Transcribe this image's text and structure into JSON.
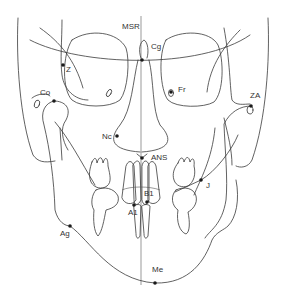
{
  "diagram": {
    "type": "frontal cephalometric tracing (PA view)",
    "colors": {
      "line": "#3a3a3a",
      "landmark": "#1a1a1a",
      "label": "#333333",
      "background": "#ffffff"
    },
    "midline_label": "MSR",
    "landmarks": [
      {
        "id": "Cg",
        "label": "Cg",
        "x": 146,
        "y": 62
      },
      {
        "id": "Z",
        "label": "Z",
        "x": 63,
        "y": 65
      },
      {
        "id": "Fr",
        "label": "Fr",
        "x": 171,
        "y": 92
      },
      {
        "id": "Co",
        "label": "Co",
        "x": 54,
        "y": 101
      },
      {
        "id": "ZA",
        "label": "ZA",
        "x": 251,
        "y": 106
      },
      {
        "id": "Nc",
        "label": "Nc",
        "x": 117,
        "y": 136
      },
      {
        "id": "ANS",
        "label": "ANS",
        "x": 142,
        "y": 158
      },
      {
        "id": "J",
        "label": "J",
        "x": 201,
        "y": 180
      },
      {
        "id": "B1",
        "label": "B1",
        "x": 147,
        "y": 202
      },
      {
        "id": "A1",
        "label": "A1",
        "x": 134,
        "y": 205
      },
      {
        "id": "Ag",
        "label": "Ag",
        "x": 70,
        "y": 226
      },
      {
        "id": "Me",
        "label": "Me",
        "x": 155,
        "y": 283
      }
    ]
  }
}
